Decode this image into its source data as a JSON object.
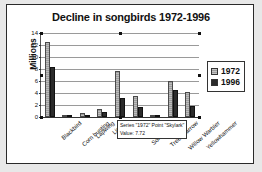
{
  "chart_data": {
    "type": "bar",
    "title": "Decline in songbirds 1972-1996",
    "xlabel": "",
    "ylabel": "Millions",
    "ylim": [
      0,
      14
    ],
    "yticks": [
      0,
      2,
      4,
      6,
      8,
      10,
      12,
      14
    ],
    "grid": true,
    "legend_position": "right",
    "categories": [
      "Blackbird",
      "Corn bunting",
      "Lapwing",
      "Linnet",
      "Skylark",
      "Song thrush",
      "Tree sparrow",
      "Willow Warbler",
      "Yellowhammer"
    ],
    "series": [
      {
        "name": "1972",
        "color": "#a8a8a8",
        "values": [
          12.5,
          0.05,
          0.6,
          1.4,
          7.72,
          3.5,
          0.3,
          6.0,
          4.2
        ]
      },
      {
        "name": "1996",
        "color": "#2b2b2b",
        "values": [
          8.4,
          0.02,
          0.3,
          0.8,
          3.1,
          1.7,
          0.1,
          4.5,
          1.8
        ]
      }
    ],
    "annotations": [
      {
        "kind": "tooltip",
        "line1": "Series \"1972\" Point \"Skylark\"",
        "line2": "Value: 7.72"
      }
    ]
  },
  "legend": {
    "items": [
      {
        "label": "1972",
        "swatch": "hatched-gray-swatch"
      },
      {
        "label": "1996",
        "swatch": "solid-black-swatch"
      }
    ]
  },
  "axis": {
    "y_title": "Millions",
    "y_tick_labels": [
      "14",
      "12",
      "10",
      "8",
      "6",
      "4",
      "2",
      "0"
    ]
  },
  "tooltip": {
    "series_point": "Series \"1972\" Point \"Skylark\"",
    "value": "Value: 7.72"
  }
}
